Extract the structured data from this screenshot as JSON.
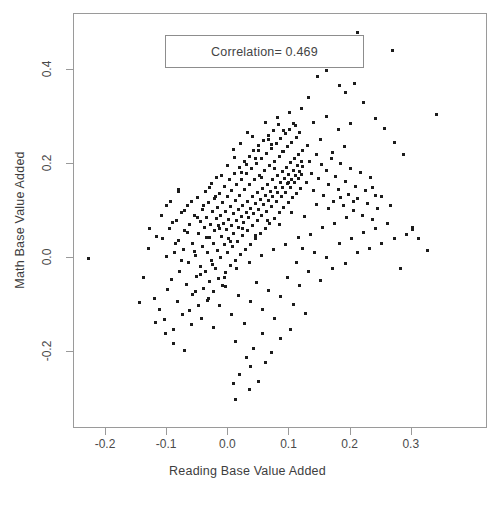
{
  "chart_data": {
    "type": "scatter",
    "title": "",
    "xlabel": "Reading Base Value Added",
    "ylabel": "Math Base Value Added",
    "xlim": [
      -0.2523,
      0.4246
    ],
    "ylim": [
      -0.3627,
      0.5183
    ],
    "xticks": [
      -0.2,
      -0.1,
      0.0,
      0.1,
      0.2,
      0.3
    ],
    "xticklabels": [
      "-0.2",
      "-0.1",
      "0.0",
      "0.1",
      "0.2",
      "0.3"
    ],
    "yticks": [
      -0.2,
      0.0,
      0.2,
      0.4
    ],
    "yticklabels": [
      "-0.2",
      "0.0",
      "0.2",
      "0.4"
    ],
    "grid": false,
    "legend_position": "top-left",
    "annotations": [
      {
        "name": "correlation-box",
        "text": "Correlation= 0.469"
      }
    ],
    "marker": {
      "shape": "square",
      "size_px": 3,
      "color": "#1c1c1c"
    },
    "n_points": 404,
    "correlation": 0.469,
    "points": [
      [
        -0.229,
        -0.001
      ],
      [
        -0.131,
        0.021
      ],
      [
        -0.121,
        -0.086
      ],
      [
        -0.117,
        0.047
      ],
      [
        -0.112,
        -0.108
      ],
      [
        -0.108,
        0.041
      ],
      [
        -0.104,
        -0.131
      ],
      [
        -0.101,
        0.004
      ],
      [
        -0.099,
        -0.067
      ],
      [
        -0.096,
        0.062
      ],
      [
        -0.093,
        -0.046
      ],
      [
        -0.09,
        -0.151
      ],
      [
        -0.088,
        0.011
      ],
      [
        -0.085,
        0.08
      ],
      [
        -0.083,
        -0.093
      ],
      [
        -0.081,
        0.037
      ],
      [
        -0.079,
        -0.028
      ],
      [
        -0.077,
        0.096
      ],
      [
        -0.075,
        -0.12
      ],
      [
        -0.073,
        0.018
      ],
      [
        -0.071,
        0.058
      ],
      [
        -0.069,
        -0.057
      ],
      [
        -0.067,
        0.112
      ],
      [
        -0.065,
        -0.01
      ],
      [
        -0.063,
        0.071
      ],
      [
        -0.061,
        -0.14
      ],
      [
        -0.059,
        0.031
      ],
      [
        -0.058,
        -0.078
      ],
      [
        -0.056,
        0.09
      ],
      [
        -0.054,
        0.006
      ],
      [
        -0.052,
        -0.039
      ],
      [
        -0.051,
        0.128
      ],
      [
        -0.049,
        0.052
      ],
      [
        -0.048,
        -0.101
      ],
      [
        -0.046,
        0.077
      ],
      [
        -0.045,
        -0.018
      ],
      [
        -0.043,
        0.104
      ],
      [
        -0.042,
        0.024
      ],
      [
        -0.041,
        -0.064
      ],
      [
        -0.039,
        0.066
      ],
      [
        -0.038,
        0.141
      ],
      [
        -0.037,
        -0.029
      ],
      [
        -0.036,
        0.086
      ],
      [
        -0.034,
        0.013
      ],
      [
        -0.033,
        -0.086
      ],
      [
        -0.032,
        0.118
      ],
      [
        -0.031,
        0.044
      ],
      [
        -0.03,
        -0.049
      ],
      [
        -0.029,
        0.072
      ],
      [
        -0.028,
        0.159
      ],
      [
        -0.027,
        -0.006
      ],
      [
        -0.026,
        0.098
      ],
      [
        -0.025,
        0.031
      ],
      [
        -0.024,
        -0.071
      ],
      [
        -0.023,
        0.126
      ],
      [
        -0.022,
        0.058
      ],
      [
        -0.021,
        -0.021
      ],
      [
        -0.02,
        0.084
      ],
      [
        -0.019,
        0.171
      ],
      [
        -0.018,
        0.016
      ],
      [
        -0.017,
        0.107
      ],
      [
        -0.016,
        -0.044
      ],
      [
        -0.015,
        0.064
      ],
      [
        -0.014,
        0.138
      ],
      [
        -0.013,
        0.002
      ],
      [
        -0.012,
        0.091
      ],
      [
        -0.011,
        0.046
      ],
      [
        -0.01,
        -0.059
      ],
      [
        -0.009,
        0.119
      ],
      [
        -0.008,
        0.073
      ],
      [
        -0.007,
        0.028
      ],
      [
        -0.006,
        0.152
      ],
      [
        -0.005,
        0.1
      ],
      [
        -0.004,
        -0.031
      ],
      [
        -0.003,
        0.061
      ],
      [
        -0.002,
        0.131
      ],
      [
        -0.001,
        0.011
      ],
      [
        0.0,
        0.083
      ],
      [
        0.001,
        0.041
      ],
      [
        0.002,
        0.167
      ],
      [
        0.003,
        0.11
      ],
      [
        0.004,
        -0.016
      ],
      [
        0.005,
        0.07
      ],
      [
        0.006,
        0.144
      ],
      [
        0.007,
        0.024
      ],
      [
        0.008,
        0.094
      ],
      [
        0.009,
        0.053
      ],
      [
        0.01,
        0.18
      ],
      [
        0.011,
        0.122
      ],
      [
        0.012,
        -0.004
      ],
      [
        0.013,
        0.079
      ],
      [
        0.014,
        0.156
      ],
      [
        0.015,
        0.036
      ],
      [
        0.016,
        0.103
      ],
      [
        0.017,
        0.065
      ],
      [
        0.018,
        0.193
      ],
      [
        0.019,
        0.133
      ],
      [
        0.02,
        0.008
      ],
      [
        0.021,
        0.088
      ],
      [
        0.022,
        0.168
      ],
      [
        0.023,
        0.048
      ],
      [
        0.024,
        0.112
      ],
      [
        0.025,
        0.076
      ],
      [
        0.026,
        0.205
      ],
      [
        0.027,
        0.145
      ],
      [
        0.028,
        0.019
      ],
      [
        0.029,
        0.097
      ],
      [
        0.03,
        0.179
      ],
      [
        0.031,
        0.059
      ],
      [
        0.032,
        0.121
      ],
      [
        0.033,
        0.086
      ],
      [
        0.034,
        0.216
      ],
      [
        0.035,
        0.156
      ],
      [
        0.036,
        0.03
      ],
      [
        0.037,
        0.106
      ],
      [
        0.038,
        0.19
      ],
      [
        0.039,
        0.069
      ],
      [
        0.04,
        0.13
      ],
      [
        0.041,
        0.095
      ],
      [
        0.042,
        0.228
      ],
      [
        0.043,
        0.166
      ],
      [
        0.044,
        0.041
      ],
      [
        0.045,
        0.115
      ],
      [
        0.046,
        0.201
      ],
      [
        0.047,
        0.08
      ],
      [
        0.048,
        0.139
      ],
      [
        0.049,
        0.104
      ],
      [
        0.05,
        0.239
      ],
      [
        0.051,
        0.176
      ],
      [
        0.052,
        0.052
      ],
      [
        0.053,
        0.124
      ],
      [
        0.054,
        0.211
      ],
      [
        0.055,
        0.09
      ],
      [
        0.056,
        0.148
      ],
      [
        0.057,
        0.113
      ],
      [
        0.058,
        0.25
      ],
      [
        0.059,
        0.186
      ],
      [
        0.06,
        0.063
      ],
      [
        0.061,
        0.133
      ],
      [
        0.062,
        0.222
      ],
      [
        0.063,
        0.1
      ],
      [
        0.064,
        0.157
      ],
      [
        0.065,
        0.122
      ],
      [
        0.066,
        0.261
      ],
      [
        0.067,
        0.196
      ],
      [
        0.068,
        0.074
      ],
      [
        0.069,
        0.142
      ],
      [
        0.07,
        0.232
      ],
      [
        0.071,
        0.11
      ],
      [
        0.072,
        0.166
      ],
      [
        0.073,
        0.131
      ],
      [
        0.074,
        0.272
      ],
      [
        0.075,
        0.206
      ],
      [
        0.076,
        0.085
      ],
      [
        0.077,
        0.151
      ],
      [
        0.078,
        0.243
      ],
      [
        0.079,
        0.12
      ],
      [
        0.08,
        0.175
      ],
      [
        0.081,
        0.14
      ],
      [
        0.082,
        0.283
      ],
      [
        0.083,
        0.216
      ],
      [
        0.084,
        0.096
      ],
      [
        0.085,
        0.16
      ],
      [
        0.086,
        0.253
      ],
      [
        0.087,
        0.13
      ],
      [
        0.088,
        0.184
      ],
      [
        0.089,
        0.149
      ],
      [
        0.09,
        0.226
      ],
      [
        0.091,
        0.107
      ],
      [
        0.092,
        0.169
      ],
      [
        0.093,
        0.264
      ],
      [
        0.094,
        0.14
      ],
      [
        0.095,
        0.193
      ],
      [
        0.096,
        0.158
      ],
      [
        0.097,
        0.236
      ],
      [
        0.098,
        0.118
      ],
      [
        0.099,
        0.178
      ],
      [
        0.1,
        0.274
      ],
      [
        0.101,
        0.15
      ],
      [
        0.102,
        0.202
      ],
      [
        0.103,
        0.167
      ],
      [
        0.104,
        0.246
      ],
      [
        0.105,
        0.128
      ],
      [
        0.106,
        0.187
      ],
      [
        0.107,
        0.285
      ],
      [
        0.108,
        0.16
      ],
      [
        0.109,
        0.211
      ],
      [
        0.11,
        0.176
      ],
      [
        0.111,
        0.256
      ],
      [
        0.112,
        0.138
      ],
      [
        0.113,
        0.196
      ],
      [
        0.114,
        0.169
      ],
      [
        0.115,
        0.22
      ],
      [
        0.116,
        0.185
      ],
      [
        0.117,
        0.266
      ],
      [
        0.118,
        0.148
      ],
      [
        0.119,
        0.205
      ],
      [
        0.12,
        0.178
      ],
      [
        0.121,
        0.229
      ],
      [
        0.122,
        0.194
      ],
      [
        -0.086,
        0.031
      ],
      [
        -0.076,
        -0.004
      ],
      [
        -0.066,
        0.054
      ],
      [
        -0.056,
        0.014
      ],
      [
        -0.046,
        -0.034
      ],
      [
        -0.036,
        0.043
      ],
      [
        -0.026,
        -0.013
      ],
      [
        -0.016,
        0.069
      ],
      [
        -0.006,
        -0.041
      ],
      [
        0.004,
        0.036
      ],
      [
        0.014,
        -0.021
      ],
      [
        0.024,
        0.063
      ],
      [
        0.034,
        -0.009
      ],
      [
        0.044,
        0.049
      ],
      [
        0.054,
        0.006
      ],
      [
        0.064,
        0.08
      ],
      [
        0.074,
        0.019
      ],
      [
        0.084,
        0.071
      ],
      [
        0.094,
        0.029
      ],
      [
        0.104,
        0.097
      ],
      [
        0.114,
        0.043
      ],
      [
        0.124,
        0.089
      ],
      [
        0.134,
        0.051
      ],
      [
        0.144,
        0.114
      ],
      [
        0.154,
        0.066
      ],
      [
        0.164,
        0.106
      ],
      [
        0.174,
        0.074
      ],
      [
        0.184,
        0.129
      ],
      [
        0.194,
        0.086
      ],
      [
        0.204,
        0.121
      ],
      [
        -0.064,
        -0.111
      ],
      [
        -0.054,
        -0.07
      ],
      [
        -0.044,
        -0.129
      ],
      [
        -0.034,
        -0.089
      ],
      [
        -0.024,
        -0.148
      ],
      [
        -0.014,
        -0.1
      ],
      [
        -0.004,
        -0.061
      ],
      [
        0.006,
        -0.119
      ],
      [
        0.016,
        -0.079
      ],
      [
        0.026,
        -0.138
      ],
      [
        0.036,
        -0.091
      ],
      [
        0.046,
        -0.051
      ],
      [
        0.056,
        -0.109
      ],
      [
        0.066,
        -0.069
      ],
      [
        0.076,
        -0.128
      ],
      [
        0.086,
        -0.081
      ],
      [
        0.096,
        -0.041
      ],
      [
        0.106,
        -0.099
      ],
      [
        0.116,
        -0.059
      ],
      [
        0.126,
        -0.118
      ],
      [
        0.01,
        0.213
      ],
      [
        0.02,
        0.244
      ],
      [
        0.03,
        0.199
      ],
      [
        0.04,
        0.258
      ],
      [
        0.05,
        0.229
      ],
      [
        0.06,
        0.288
      ],
      [
        0.07,
        0.241
      ],
      [
        0.08,
        0.299
      ],
      [
        0.09,
        0.271
      ],
      [
        0.1,
        0.309
      ],
      [
        0.11,
        0.281
      ],
      [
        0.12,
        0.318
      ],
      [
        0.13,
        0.239
      ],
      [
        0.14,
        0.289
      ],
      [
        0.15,
        0.251
      ],
      [
        0.16,
        0.301
      ],
      [
        0.17,
        0.224
      ],
      [
        0.18,
        0.274
      ],
      [
        0.19,
        0.236
      ],
      [
        0.2,
        0.286
      ],
      [
        0.128,
        0.161
      ],
      [
        0.132,
        0.206
      ],
      [
        0.136,
        0.18
      ],
      [
        0.14,
        0.143
      ],
      [
        0.144,
        0.221
      ],
      [
        0.148,
        0.169
      ],
      [
        0.152,
        0.198
      ],
      [
        0.156,
        0.132
      ],
      [
        0.16,
        0.186
      ],
      [
        0.164,
        0.156
      ],
      [
        0.168,
        0.211
      ],
      [
        0.172,
        0.121
      ],
      [
        0.176,
        0.173
      ],
      [
        0.18,
        0.146
      ],
      [
        0.184,
        0.201
      ],
      [
        0.188,
        0.111
      ],
      [
        0.192,
        0.163
      ],
      [
        0.196,
        0.136
      ],
      [
        0.2,
        0.191
      ],
      [
        0.204,
        0.101
      ],
      [
        0.208,
        0.153
      ],
      [
        0.212,
        0.126
      ],
      [
        0.216,
        0.181
      ],
      [
        0.22,
        0.091
      ],
      [
        0.224,
        0.143
      ],
      [
        0.228,
        0.116
      ],
      [
        0.232,
        0.171
      ],
      [
        0.236,
        0.081
      ],
      [
        0.24,
        0.133
      ],
      [
        0.244,
        0.106
      ],
      [
        0.111,
        -0.01
      ],
      [
        0.121,
        0.021
      ],
      [
        0.131,
        -0.029
      ],
      [
        0.141,
        0.011
      ],
      [
        0.151,
        -0.048
      ],
      [
        0.161,
        0.001
      ],
      [
        0.171,
        -0.021
      ],
      [
        0.181,
        0.031
      ],
      [
        0.191,
        -0.011
      ],
      [
        0.201,
        0.041
      ],
      [
        0.211,
        0.011
      ],
      [
        0.221,
        0.054
      ],
      [
        0.231,
        0.021
      ],
      [
        0.241,
        0.064
      ],
      [
        0.251,
        0.031
      ],
      [
        0.261,
        0.074
      ],
      [
        0.271,
        0.041
      ],
      [
        0.281,
        -0.021
      ],
      [
        0.291,
        0.051
      ],
      [
        0.301,
        0.061
      ],
      [
        -0.146,
        -0.094
      ],
      [
        -0.139,
        -0.041
      ],
      [
        -0.129,
        0.064
      ],
      [
        -0.119,
        -0.136
      ],
      [
        -0.109,
        0.091
      ],
      [
        -0.102,
        -0.161
      ],
      [
        -0.095,
        0.121
      ],
      [
        -0.089,
        -0.181
      ],
      [
        -0.082,
        0.146
      ],
      [
        -0.071,
        -0.196
      ],
      [
        0.012,
        -0.176
      ],
      [
        0.029,
        -0.211
      ],
      [
        0.041,
        -0.191
      ],
      [
        0.056,
        -0.161
      ],
      [
        0.071,
        -0.201
      ],
      [
        0.086,
        -0.171
      ],
      [
        0.101,
        -0.151
      ],
      [
        0.019,
        -0.246
      ],
      [
        0.037,
        -0.231
      ],
      [
        0.061,
        -0.221
      ],
      [
        0.034,
        -0.278
      ],
      [
        0.049,
        -0.261
      ],
      [
        0.011,
        -0.301
      ],
      [
        0.039,
        -0.363
      ],
      [
        0.009,
        -0.266
      ],
      [
        0.211,
        0.478
      ],
      [
        0.269,
        0.441
      ],
      [
        0.34,
        0.304
      ],
      [
        0.161,
        0.398
      ],
      [
        0.181,
        0.366
      ],
      [
        0.131,
        0.341
      ],
      [
        0.146,
        0.386
      ],
      [
        0.191,
        0.351
      ],
      [
        0.206,
        0.371
      ],
      [
        0.221,
        0.331
      ],
      [
        0.241,
        0.296
      ],
      [
        0.256,
        0.276
      ],
      [
        0.271,
        0.246
      ],
      [
        0.286,
        0.221
      ],
      [
        0.301,
        0.066
      ],
      [
        0.311,
        0.041
      ],
      [
        0.326,
        0.016
      ],
      [
        0.251,
        0.131
      ],
      [
        0.266,
        0.111
      ],
      [
        0.236,
        0.151
      ],
      [
        -0.001,
        0.196
      ],
      [
        0.009,
        0.231
      ],
      [
        0.021,
        0.181
      ],
      [
        0.031,
        0.266
      ],
      [
        0.044,
        0.211
      ],
      [
        0.054,
        0.171
      ],
      [
        0.066,
        0.251
      ],
      [
        0.076,
        0.191
      ],
      [
        0.089,
        0.226
      ],
      [
        0.099,
        0.161
      ],
      [
        -0.041,
        0.111
      ],
      [
        -0.031,
        0.151
      ],
      [
        -0.021,
        0.131
      ],
      [
        -0.011,
        0.176
      ],
      [
        -0.051,
        0.086
      ],
      [
        -0.061,
        0.121
      ],
      [
        -0.071,
        0.101
      ],
      [
        -0.081,
        0.141
      ],
      [
        -0.091,
        0.076
      ],
      [
        -0.101,
        0.111
      ]
    ]
  }
}
